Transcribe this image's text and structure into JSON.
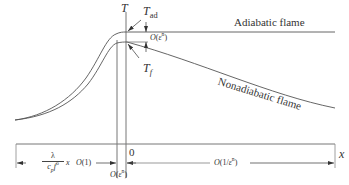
{
  "diagram": {
    "type": "flame temperature profile schematic",
    "axes": {
      "vertical_label": "T",
      "horizontal_label": "x",
      "origin_label": "0"
    },
    "curves": [
      {
        "name": "Adiabatic flame",
        "label": "Adiabatic flame"
      },
      {
        "name": "Nonadiabatic flame",
        "label": "Nonadiabatic flame"
      }
    ],
    "annotations": {
      "t_ad": {
        "main": "T",
        "sub": "ad"
      },
      "t_f": {
        "main": "T",
        "sub": "f"
      },
      "gap_order": {
        "prefix": "O(ε",
        "sup": "n",
        "suffix": ")"
      }
    },
    "regions": {
      "preheat": {
        "scale_num": "λ",
        "scale_den_main": "c",
        "scale_den_sub": "p",
        "scale_den_f": "f",
        "scale_den_sup": "o",
        "scale_var": "x",
        "order": "O(1)"
      },
      "reaction": {
        "prefix": "O(ε",
        "sup": "n",
        "suffix": ")"
      },
      "postflame": {
        "prefix": "O(1/ε",
        "sup": "n",
        "suffix": ")"
      }
    },
    "colors": {
      "line": "#555555",
      "text": "#333333",
      "background": "#ffffff"
    }
  }
}
